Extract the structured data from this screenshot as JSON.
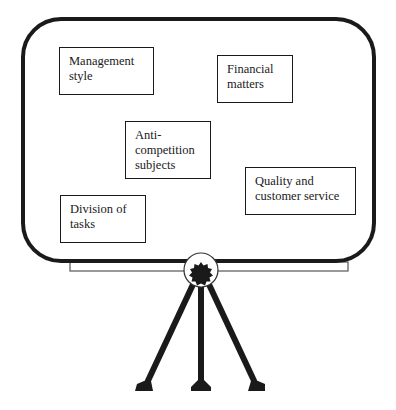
{
  "diagram": {
    "type": "flipchart-board-on-tripod",
    "board": {
      "border_color": "#1a1a1a",
      "fill": "#ffffff"
    },
    "notes": [
      {
        "id": "management-style",
        "lines": [
          "Management",
          "style"
        ],
        "box": {
          "x": 59,
          "y": 47,
          "w": 95,
          "h": 48
        }
      },
      {
        "id": "financial-matters",
        "lines": [
          "Financial",
          "matters"
        ],
        "box": {
          "x": 217,
          "y": 55,
          "w": 76,
          "h": 48
        }
      },
      {
        "id": "anti-competition-subjects",
        "lines": [
          "Anti-",
          "competition",
          "subjects"
        ],
        "box": {
          "x": 125,
          "y": 121,
          "w": 86,
          "h": 58
        }
      },
      {
        "id": "quality-and-customer-service",
        "lines": [
          "Quality and",
          "customer service"
        ],
        "box": {
          "x": 245,
          "y": 167,
          "w": 111,
          "h": 48
        }
      },
      {
        "id": "division-of-tasks",
        "lines": [
          "Division of",
          "tasks"
        ],
        "box": {
          "x": 60,
          "y": 195,
          "w": 86,
          "h": 48
        }
      }
    ]
  }
}
